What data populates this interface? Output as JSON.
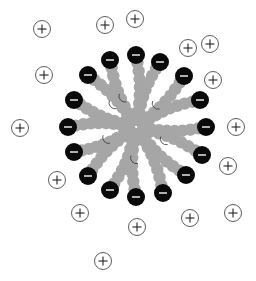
{
  "colors": {
    "background": "#ffffff",
    "tail": "#a6a6a6",
    "head": "#0a0a0a",
    "head_sign": "#d9d9d9",
    "counterion_stroke": "#333333",
    "counterion_fill": "#ffffff"
  },
  "micelle": {
    "head_group_charge": "−",
    "head_group_count": 16,
    "tail_segments_per_chain": 6
  },
  "counterions": {
    "charge": "+",
    "count": 16
  }
}
